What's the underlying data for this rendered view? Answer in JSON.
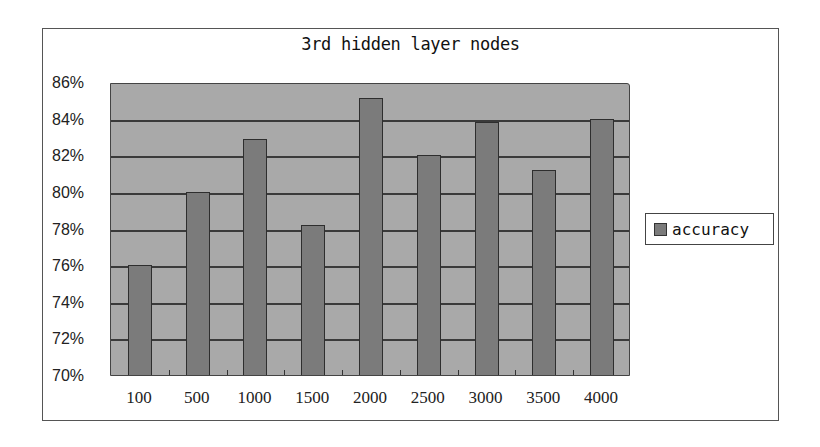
{
  "chart_data": {
    "type": "bar",
    "title": "3rd hidden layer nodes",
    "xlabel": "",
    "ylabel": "",
    "categories": [
      "100",
      "500",
      "1000",
      "1500",
      "2000",
      "2500",
      "3000",
      "3500",
      "4000"
    ],
    "series": [
      {
        "name": "accuracy",
        "values": [
          76.0,
          80.0,
          82.9,
          78.2,
          85.1,
          82.0,
          83.8,
          81.2,
          84.0
        ]
      }
    ],
    "ylim": [
      70,
      86
    ],
    "yticks": [
      "70%",
      "72%",
      "74%",
      "76%",
      "78%",
      "80%",
      "82%",
      "84%",
      "86%"
    ],
    "grid": true,
    "legend_position": "right",
    "colors": {
      "plot_background": "#a9a9a9",
      "bar": "#7b7b7b",
      "gridline": "#3a3a3a"
    }
  },
  "legend": {
    "label": "accuracy"
  }
}
